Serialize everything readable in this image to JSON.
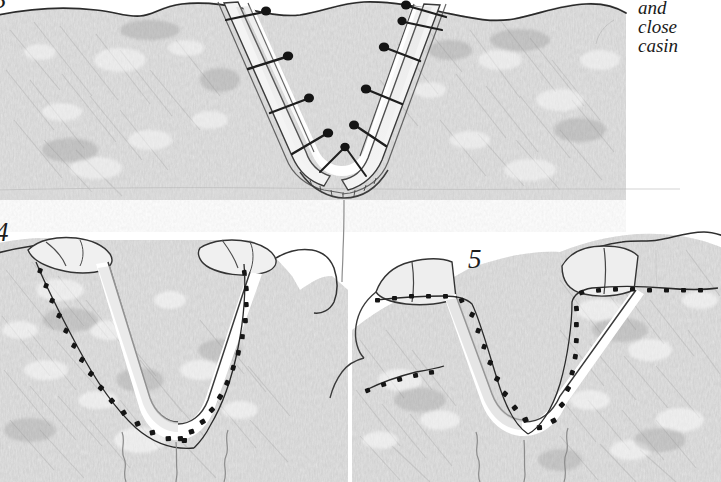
{
  "page": {
    "medium": "graphite pencil drawing on white paper",
    "background_color": "#ffffff",
    "ink_color": "#1c1c1c",
    "graphite_light": "#e8e8e8",
    "graphite_mid": "#c9c9c9",
    "graphite_dark": "#9a9a9a"
  },
  "caption": {
    "lines": [
      "and",
      "close",
      "casin"
    ],
    "note": "italic handwritten-style caption, clipped at right edge of image"
  },
  "figures": [
    {
      "number": "3",
      "label": "3",
      "title": "V-shaped incision held open with pins",
      "description": "Wide tissue block with wavy upper contour; a deep V-shaped trough runs down the centre, its walls lined with a pale band. Dark-headed pins are driven through the band on both sides with their shafts angled outward. A fine vertical crease descends from the apex of the V."
    },
    {
      "number": "4",
      "label": "4",
      "title": "Flap edges approximated with running suture",
      "description": "V-shaped flap with rolled-back upper cuffs on each limb; a dotted running suture line follows the whole inner margin from the top of each cuff down around the rounded apex. Wavy vertical creases run below the apex."
    },
    {
      "number": "5",
      "label": "5",
      "title": "Closure viewed from the opposite side",
      "description": "Angled view of the same V closure; dotted suture lines follow the inner margin and continue horizontally across the tissue surface on both sides. Rolled cuffs sit at the top of each limb."
    }
  ],
  "marker_counts": {
    "figure_3_pins_left": 5,
    "figure_3_pins_right": 5,
    "figure_4_suture_dots_left": 16,
    "figure_4_suture_dots_right": 16,
    "figure_5_suture_dots_left": 18,
    "figure_5_suture_dots_right": 22
  }
}
